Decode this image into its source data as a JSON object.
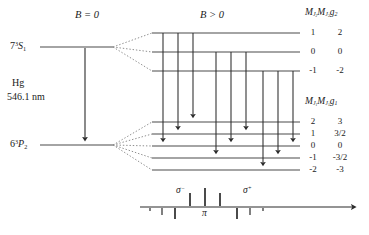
{
  "diagram": {
    "headers": {
      "zero_field": "B = 0",
      "with_field": "B > 0"
    },
    "source": {
      "element": "Hg",
      "wavelength": "546.1 nm"
    },
    "upper_state": {
      "term_prefix": "7",
      "term_mult": "3",
      "term_letter": "S",
      "term_j": "1"
    },
    "lower_state": {
      "term_prefix": "6",
      "term_mult": "3",
      "term_letter": "P",
      "term_j": "2"
    },
    "upper_table": {
      "col1_prefix": "M",
      "col1_sub": "J",
      "col1_sub2": "2",
      "col2_prefix": "M",
      "col2_sub": "J",
      "col2_sub2": "2",
      "col2_g": "g",
      "col2_gsub": "2",
      "rows": [
        {
          "mj": "1",
          "mjg": "2",
          "y": 33
        },
        {
          "mj": "0",
          "mjg": "0",
          "y": 52
        },
        {
          "mj": "-1",
          "mjg": "-2",
          "y": 71
        }
      ]
    },
    "lower_table": {
      "col1_prefix": "M",
      "col1_sub": "J",
      "col1_sub2": "1",
      "col2_prefix": "M",
      "col2_sub": "J",
      "col2_sub2": "1",
      "col2_g": "g",
      "col2_gsub": "1",
      "rows": [
        {
          "mj": "2",
          "mjg": "3",
          "y": 122
        },
        {
          "mj": "1",
          "mjg": "3/2",
          "y": 134
        },
        {
          "mj": "0",
          "mjg": "0",
          "y": 146
        },
        {
          "mj": "-1",
          "mjg": "-3/2",
          "y": 158
        },
        {
          "mj": "-2",
          "mjg": "-3",
          "y": 170
        }
      ]
    },
    "spectrum": {
      "baseline_y": 207,
      "axis_x_start": 140,
      "axis_x_end": 355,
      "labels": {
        "sigma_minus": "σ",
        "sigma_minus_sup": "−",
        "pi": "π",
        "sigma_plus": "σ",
        "sigma_plus_sup": "+"
      },
      "lines": [
        {
          "x": 150,
          "h": 3,
          "side": "down"
        },
        {
          "x": 162,
          "h": 7,
          "side": "down"
        },
        {
          "x": 175,
          "h": 11,
          "side": "down"
        },
        {
          "x": 190,
          "h": 13,
          "side": "up"
        },
        {
          "x": 205,
          "h": 18,
          "side": "up"
        },
        {
          "x": 220,
          "h": 13,
          "side": "up"
        },
        {
          "x": 237,
          "h": 11,
          "side": "down"
        },
        {
          "x": 250,
          "h": 7,
          "side": "down"
        },
        {
          "x": 263,
          "h": 3,
          "side": "down"
        }
      ]
    },
    "colors": {
      "ink": "#1a1a1a",
      "level_line": "#4a4a4a",
      "dotted": "#8a8a8a",
      "background": "#ffffff"
    }
  }
}
